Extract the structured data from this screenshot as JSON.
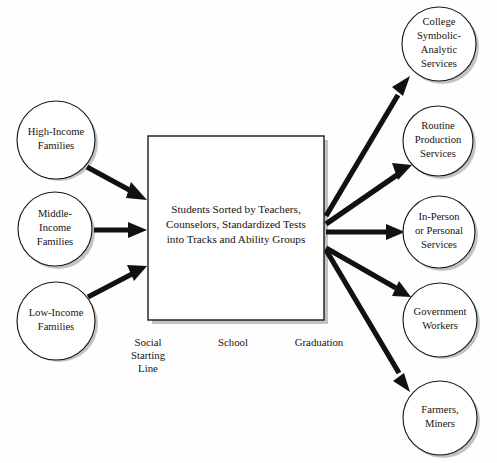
{
  "diagram": {
    "title": "Students Sorted by Teachers, Counselors, Standardized Tests into Tracks and Ability Groups",
    "colors": {
      "background": "#ffffff",
      "stroke": "#1a1a1a",
      "arrow": "#111111",
      "text": "#17120f",
      "shadow": "#b9b9b9"
    },
    "center_box": {
      "lines": [
        "Students Sorted by Teachers,",
        "Counselors, Standardized Tests",
        "into Tracks and Ability Groups"
      ]
    },
    "inputs": [
      {
        "id": "high-income-families",
        "lines": [
          "High-Income",
          "Families"
        ]
      },
      {
        "id": "middle-income-families",
        "lines": [
          "Middle-",
          "Income",
          "Families"
        ]
      },
      {
        "id": "low-income-families",
        "lines": [
          "Low-Income",
          "Families"
        ]
      }
    ],
    "outputs": [
      {
        "id": "college-symbolic-analytic-services",
        "lines": [
          "College",
          "Symbolic-",
          "Analytic",
          "Services"
        ]
      },
      {
        "id": "routine-production-services",
        "lines": [
          "Routine",
          "Production",
          "Services"
        ]
      },
      {
        "id": "in-person-or-personal-services",
        "lines": [
          "In-Person",
          "or Personal",
          "Services"
        ]
      },
      {
        "id": "government-workers",
        "lines": [
          "Government",
          "Workers"
        ]
      },
      {
        "id": "farmers-miners",
        "lines": [
          "Farmers,",
          "Miners"
        ]
      }
    ],
    "stages": [
      {
        "id": "social-starting-line",
        "lines": [
          "Social",
          "Starting",
          "Line"
        ]
      },
      {
        "id": "school",
        "lines": [
          "School"
        ]
      },
      {
        "id": "graduation",
        "lines": [
          "Graduation"
        ]
      }
    ]
  }
}
